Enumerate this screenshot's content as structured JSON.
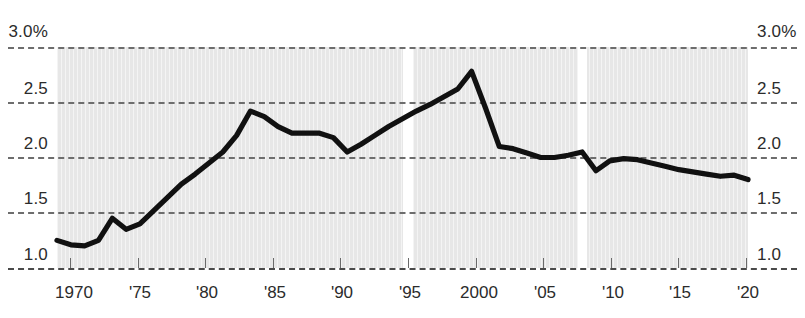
{
  "chart_data": {
    "type": "line",
    "title": "",
    "subtitle": "",
    "xlabel": "",
    "ylabel": "",
    "ylim": [
      1.0,
      3.0
    ],
    "xlim": [
      1970,
      2020
    ],
    "grid": true,
    "legend": null,
    "y_ticks": [
      1.0,
      1.5,
      2.0,
      2.5,
      3.0
    ],
    "y_tick_labels_left": [
      "1.0",
      "1.5",
      "2.0",
      "2.5",
      "3.0%"
    ],
    "y_tick_labels_right": [
      "1.0",
      "1.5",
      "2.0",
      "2.5",
      "3.0%"
    ],
    "x_ticks": [
      1970,
      1975,
      1980,
      1985,
      1990,
      1995,
      2000,
      2005,
      2010,
      2015,
      2020
    ],
    "x_tick_labels": [
      "1970",
      "'75",
      "'80",
      "'85",
      "'90",
      "'95",
      "2000",
      "'05",
      "'10",
      "'15",
      "'20"
    ],
    "line_color": "#111111",
    "plot_background": "#e7e7e7",
    "gap_bands": [
      {
        "start": 1994.6,
        "end": 1995.4
      },
      {
        "start": 2007.6,
        "end": 2008.3
      }
    ],
    "series": [
      {
        "name": "value",
        "x": [
          1970,
          1971,
          1972,
          1973,
          1974,
          1975,
          1976,
          1977,
          1978,
          1979,
          1980,
          1981,
          1982,
          1983,
          1984,
          1985,
          1986,
          1987,
          1988,
          1989,
          1990,
          1991,
          1992,
          1993,
          1994,
          1995,
          1996,
          1997,
          1998,
          1999,
          2000,
          2001,
          2002,
          2003,
          2004,
          2005,
          2006,
          2007,
          2008,
          2009,
          2010,
          2011,
          2012,
          2013,
          2014,
          2015,
          2016,
          2017,
          2018,
          2019,
          2020
        ],
        "values": [
          1.25,
          1.21,
          1.2,
          1.25,
          1.45,
          1.35,
          1.4,
          1.52,
          1.64,
          1.76,
          1.85,
          1.95,
          2.05,
          2.2,
          2.42,
          2.37,
          2.28,
          2.22,
          2.22,
          2.22,
          2.18,
          2.05,
          2.12,
          2.2,
          2.28,
          2.35,
          2.42,
          2.48,
          2.55,
          2.62,
          2.78,
          2.45,
          2.1,
          2.08,
          2.04,
          2.0,
          2.0,
          2.02,
          2.05,
          1.88,
          1.97,
          1.99,
          1.98,
          1.95,
          1.92,
          1.89,
          1.87,
          1.85,
          1.83,
          1.84,
          1.8
        ]
      }
    ]
  }
}
